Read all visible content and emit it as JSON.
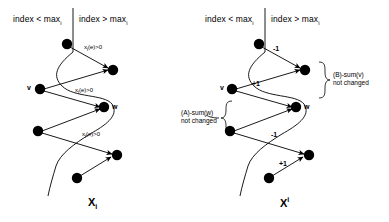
{
  "figure": {
    "panels": [
      {
        "id": "left",
        "caption": "X",
        "caption_sub": "i",
        "header_left": "index < max",
        "header_left_sub": "i",
        "header_right": "index > max",
        "header_right_sub": "i",
        "node_labels": {
          "v": "v",
          "w": "w"
        },
        "edge_labels": [
          {
            "text": "x",
            "sub": "i",
            "rest": "(e)>0"
          },
          {
            "text": "x",
            "sub": "i",
            "rest": "(e)>0"
          },
          {
            "text": "x",
            "sub": "i",
            "rest": "(e)>0"
          }
        ]
      },
      {
        "id": "right",
        "caption": "X",
        "caption_sup": "i",
        "header_left": "index < max",
        "header_left_sub": "i",
        "header_right": "index > max",
        "header_right_sub": "i",
        "node_labels": {
          "v": "v",
          "w": "w"
        },
        "sign_labels": [
          "-1",
          "+1",
          "-1",
          "+1"
        ],
        "annotations": [
          {
            "line1": "(A)-sum(w)",
            "line2": "not changed"
          },
          {
            "line1": "(B)-sum(v)",
            "line2": "not changed"
          }
        ]
      }
    ],
    "colors": {
      "stroke": "#000000",
      "node_fill": "#000000",
      "background": "#ffffff"
    }
  }
}
